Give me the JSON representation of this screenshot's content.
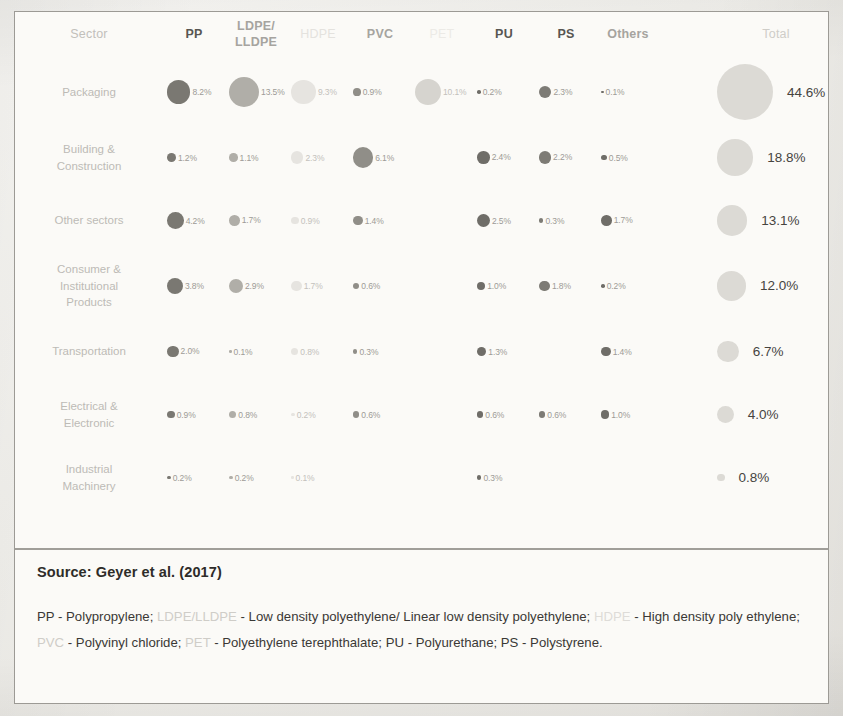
{
  "figure": {
    "source_label": "Source: Geyer et al. (2017)",
    "sector_header": "Sector",
    "total_header": "Total"
  },
  "columns": [
    {
      "key": "pp",
      "label": "PP",
      "tone": "strong"
    },
    {
      "key": "ldpe",
      "label": "LDPE/\nLLDPE",
      "tone": "mid"
    },
    {
      "key": "hdpe",
      "label": "HDPE",
      "tone": "faint"
    },
    {
      "key": "pvc",
      "label": "PVC",
      "tone": "mid"
    },
    {
      "key": "pet",
      "label": "PET",
      "tone": "vfaint"
    },
    {
      "key": "pu",
      "label": "PU",
      "tone": "strong"
    },
    {
      "key": "ps",
      "label": "PS",
      "tone": "strong"
    },
    {
      "key": "others",
      "label": "Others",
      "tone": "mid"
    }
  ],
  "legend": {
    "pp_term": "PP - Polypropylene;",
    "ldpe_abbr": "LDPE/LLDPE",
    "ldpe_term": " - Low density polyethylene/ Linear low density polyethylene;",
    "hdpe_abbr": "HDPE",
    "hdpe_term": " - High density poly ethylene;",
    "pvc_abbr": "PVC",
    "pvc_term": " - Polyvinyl chloride;",
    "pet_abbr": "PET",
    "pet_term": " - Polyethylene terephthalate;",
    "pu_term": " PU - Polyurethane;",
    "ps_term": " PS - Polystyrene."
  },
  "chart_data": {
    "type": "heatmap",
    "xlabel": "Polymer type",
    "ylabel": "Sector",
    "value_unit": "%",
    "categories": [
      "PP",
      "LDPE/LLDPE",
      "HDPE",
      "PVC",
      "PET",
      "PU",
      "PS",
      "Others"
    ],
    "rows": [
      {
        "sector": "Packaging",
        "values": [
          8.2,
          13.5,
          9.3,
          0.9,
          10.1,
          0.2,
          2.3,
          0.1
        ],
        "labels": [
          "8.2%",
          "13.5%",
          "9.3%",
          "0.9%",
          "10.1%",
          "0.2%",
          "2.3%",
          "0.1%"
        ],
        "total": 44.6,
        "total_label": "44.6%"
      },
      {
        "sector": "Building &\nConstruction",
        "values": [
          1.2,
          1.1,
          2.3,
          6.1,
          null,
          2.4,
          2.2,
          0.5
        ],
        "labels": [
          "1.2%",
          "1.1%",
          "2.3%",
          "6.1%",
          "",
          "2.4%",
          "2.2%",
          "0.5%"
        ],
        "total": 18.8,
        "total_label": "18.8%"
      },
      {
        "sector": "Other sectors",
        "values": [
          4.2,
          1.7,
          0.9,
          1.4,
          null,
          2.5,
          0.3,
          1.7
        ],
        "labels": [
          "4.2%",
          "1.7%",
          "0.9%",
          "1.4%",
          "",
          "2.5%",
          "0.3%",
          "1.7%"
        ],
        "total": 13.1,
        "total_label": "13.1%"
      },
      {
        "sector": "Consumer &\nInstitutional\nProducts",
        "values": [
          3.8,
          2.9,
          1.7,
          0.6,
          null,
          1.0,
          1.8,
          0.2
        ],
        "labels": [
          "3.8%",
          "2.9%",
          "1.7%",
          "0.6%",
          "",
          "1.0%",
          "1.8%",
          "0.2%"
        ],
        "total": 12.0,
        "total_label": "12.0%"
      },
      {
        "sector": "Transportation",
        "values": [
          2.0,
          0.1,
          0.8,
          0.3,
          null,
          1.3,
          null,
          1.4
        ],
        "labels": [
          "2.0%",
          "0.1%",
          "0.8%",
          "0.3%",
          "",
          "1.3%",
          "",
          "1.4%"
        ],
        "total": 6.7,
        "total_label": "6.7%"
      },
      {
        "sector": "Electrical &\nElectronic",
        "values": [
          0.9,
          0.8,
          0.2,
          0.6,
          null,
          0.6,
          0.6,
          1.0
        ],
        "labels": [
          "0.9%",
          "0.8%",
          "0.2%",
          "0.6%",
          "",
          "0.6%",
          "0.6%",
          "1.0%"
        ],
        "total": 4.0,
        "total_label": "4.0%"
      },
      {
        "sector": "Industrial\nMachinery",
        "values": [
          0.2,
          0.2,
          0.1,
          null,
          null,
          0.3,
          null,
          null
        ],
        "labels": [
          "0.2%",
          "0.2%",
          "0.1%",
          "",
          "",
          "0.3%",
          "",
          ""
        ],
        "total": 0.8,
        "total_label": "0.8%"
      }
    ]
  }
}
